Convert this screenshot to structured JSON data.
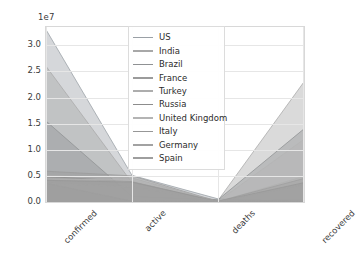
{
  "chart_data": {
    "type": "area",
    "title": "",
    "xlabel": "",
    "ylabel": "",
    "offset_text": "1e7",
    "categories": [
      "confirmed",
      "active",
      "deaths",
      "recovered"
    ],
    "ytick_labels": [
      "0.0",
      "0.5",
      "1.0",
      "1.5",
      "2.0",
      "2.5",
      "3.0"
    ],
    "ytick_values": [
      0,
      5000000,
      10000000,
      15000000,
      20000000,
      25000000,
      30000000
    ],
    "ylim": [
      0,
      33500000
    ],
    "grid": true,
    "legend_position": "upper center",
    "series": [
      {
        "name": "US",
        "color": "#9aa0a6",
        "values": [
          33000000,
          5100000,
          600000,
          0
        ]
      },
      {
        "name": "India",
        "color": "#a8a8a8",
        "values": [
          26000000,
          3700000,
          300000,
          23000000
        ]
      },
      {
        "name": "Brazil",
        "color": "#8f9193",
        "values": [
          15500000,
          1100000,
          430000,
          14000000
        ]
      },
      {
        "name": "France",
        "color": "#9b9b9b",
        "values": [
          5900000,
          5000000,
          108000,
          400000
        ]
      },
      {
        "name": "Turkey",
        "color": "#adadad",
        "values": [
          5100000,
          4600000,
          45000,
          4900000
        ]
      },
      {
        "name": "Russia",
        "color": "#8c8c8c",
        "values": [
          4900000,
          3900000,
          113000,
          4500000
        ]
      },
      {
        "name": "United Kingdom",
        "color": "#b4b4b4",
        "values": [
          4450000,
          4200000,
          128000,
          12000000
        ]
      },
      {
        "name": "Italy",
        "color": "#979797",
        "values": [
          4150000,
          3800000,
          124000,
          3700000
        ]
      },
      {
        "name": "Germany",
        "color": "#a2a2a2",
        "values": [
          3600000,
          2900000,
          86000,
          3300000
        ]
      },
      {
        "name": "Spain",
        "color": "#9e9e9e",
        "values": [
          3600000,
          150000,
          79000,
          150000
        ]
      }
    ]
  },
  "legend": {
    "items": [
      {
        "label": "US"
      },
      {
        "label": "India"
      },
      {
        "label": "Brazil"
      },
      {
        "label": "France"
      },
      {
        "label": "Turkey"
      },
      {
        "label": "Russia"
      },
      {
        "label": "United Kingdom"
      },
      {
        "label": "Italy"
      },
      {
        "label": "Germany"
      },
      {
        "label": "Spain"
      }
    ]
  },
  "style": {
    "axis_color": "#d8d8d8",
    "grid_color": "#e6e6e6",
    "tick_text_color": "#3a3a3a",
    "plot_bg": "#ffffff",
    "figure_bg": "#ffffff"
  }
}
